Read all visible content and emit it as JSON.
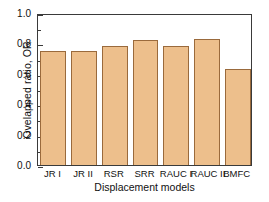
{
  "chart_data": {
    "type": "bar",
    "title": "",
    "xlabel": "Displacement models",
    "ylabel": "Ovelapped ratio, OR",
    "categories": [
      "JR I",
      "JR II",
      "RSR",
      "SRR",
      "RAUC I",
      "RAUC II",
      "BMFC"
    ],
    "values": [
      0.75,
      0.75,
      0.78,
      0.82,
      0.78,
      0.83,
      0.63
    ],
    "series": [
      {
        "name": "Overlapped ratio",
        "values": [
          0.75,
          0.75,
          0.78,
          0.82,
          0.78,
          0.83,
          0.63
        ]
      }
    ],
    "ylim": [
      0.0,
      1.0
    ],
    "yticks": [
      "0.0",
      "0.2",
      "0.4",
      "0.6",
      "0.8",
      "1.0"
    ],
    "ytick_values": [
      0.0,
      0.2,
      0.4,
      0.6,
      0.8,
      1.0
    ],
    "y_minor_ticks": [
      0.1,
      0.3,
      0.5,
      0.7,
      0.9
    ],
    "grid": false,
    "legend": null,
    "legend_position": "none",
    "bar_fill_color": "#edbf8c",
    "bar_edge_color": "#9a6a3c",
    "axis_color": "#3a3a3a",
    "background_color": "#ffffff"
  }
}
